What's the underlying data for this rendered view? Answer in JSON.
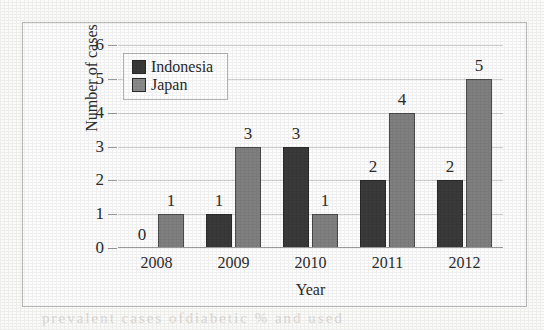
{
  "chart_data": {
    "type": "bar",
    "title": "",
    "xlabel": "Year",
    "ylabel": "Number of cases",
    "categories": [
      "2008",
      "2009",
      "2010",
      "2011",
      "2012"
    ],
    "series": [
      {
        "name": "Indonesia",
        "color": "#3a3a3a",
        "values": [
          0,
          1,
          3,
          2,
          2
        ]
      },
      {
        "name": "Japan",
        "color": "#808080",
        "values": [
          1,
          3,
          1,
          4,
          5
        ]
      }
    ],
    "ylim": [
      0,
      6
    ],
    "yticks": [
      "0",
      "1",
      "2",
      "3",
      "4",
      "5",
      "6"
    ],
    "grid": true,
    "legend_position": "upper-left-inside",
    "data_labels": true
  },
  "artifacts": {
    "bleed_bottom": "prevalent  cases  ofdiabetic  %  and     used",
    "bleed_under": "                                                          "
  }
}
